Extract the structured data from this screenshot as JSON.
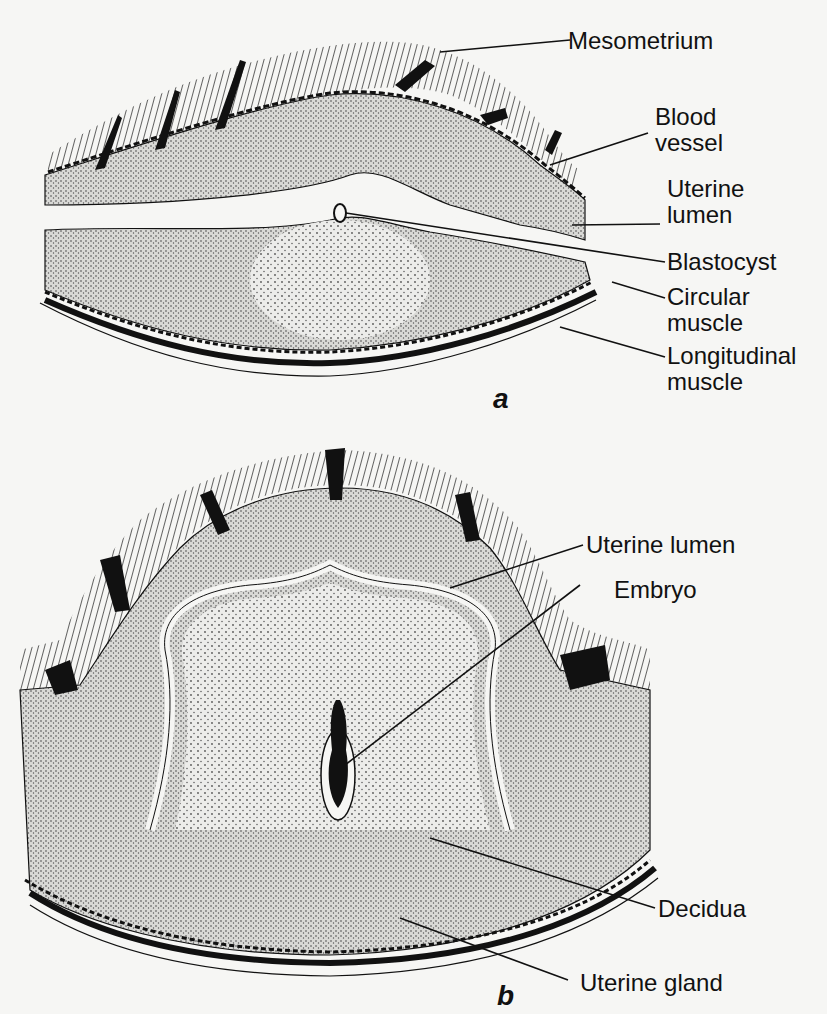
{
  "figure": {
    "panel_a": {
      "tag": "a",
      "labels": [
        {
          "line1": "Mesometrium",
          "line2": ""
        },
        {
          "line1": "Blood",
          "line2": "vessel"
        },
        {
          "line1": "Uterine",
          "line2": "lumen"
        },
        {
          "line1": "Blastocyst",
          "line2": ""
        },
        {
          "line1": "Circular",
          "line2": "muscle"
        },
        {
          "line1": "Longitudinal",
          "line2": "muscle"
        }
      ]
    },
    "panel_b": {
      "tag": "b",
      "labels": [
        {
          "text": "Uterine lumen"
        },
        {
          "text": "Embryo"
        },
        {
          "text": "Decidua"
        },
        {
          "text": "Uterine gland"
        }
      ]
    },
    "colors": {
      "ink": "#111111",
      "paper": "#f6f6f4",
      "stipple": "#9a9a9a",
      "stipple_light": "#c8c8c8"
    }
  }
}
